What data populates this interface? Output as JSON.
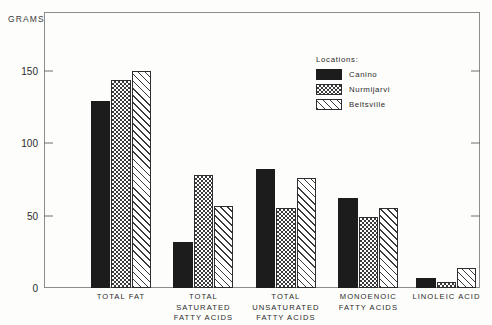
{
  "axis_unit_label": "GRAMS",
  "legend": {
    "title": "Locations:",
    "entries": [
      {
        "label": "Canino",
        "pattern": "solid-black"
      },
      {
        "label": "Nurmijarvi",
        "pattern": "checkerboard"
      },
      {
        "label": "Beltsville",
        "pattern": "diagonal-hatch"
      }
    ]
  },
  "chart_data": {
    "type": "bar",
    "title": "",
    "xlabel": "",
    "ylabel": "GRAMS",
    "ylim": [
      0,
      190
    ],
    "yticks": [
      0,
      50,
      100,
      150
    ],
    "ytick_labels": [
      "0",
      "50",
      "100",
      "150"
    ],
    "grid": false,
    "legend_position": "upper-right-inside",
    "categories": [
      "TOTAL FAT",
      "TOTAL\nSATURATED\nFATTY ACIDS",
      "TOTAL\nUNSATURATED\nFATTY ACIDS",
      "MONOENOIC\nFATTY ACIDS",
      "LINOLEIC ACID"
    ],
    "series": [
      {
        "name": "Canino",
        "values": [
          129,
          32,
          82,
          62,
          7
        ]
      },
      {
        "name": "Nurmijarvi",
        "values": [
          144,
          78,
          55,
          49,
          4
        ]
      },
      {
        "name": "Beltsville",
        "values": [
          150,
          57,
          76,
          55,
          14
        ]
      }
    ]
  }
}
